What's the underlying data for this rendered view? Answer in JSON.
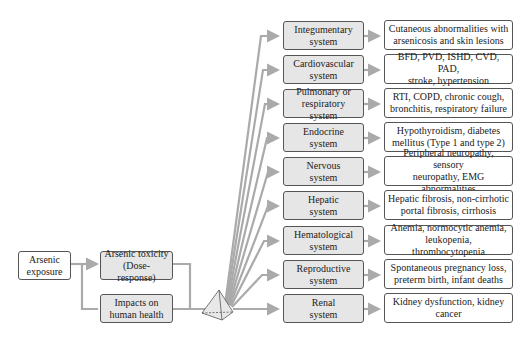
{
  "start": {
    "label_line1": "Arsenic",
    "label_line2": "exposure"
  },
  "toxicity": {
    "label_line1": "Arsenic toxicity",
    "label_line2": "(Dose-response)"
  },
  "impacts": {
    "label_line1": "Impacts on",
    "label_line2": "human health"
  },
  "hub_icon": "pyramid-icon",
  "colors": {
    "arrow": "#aaaaaa",
    "box_border": "#555555",
    "shaded_fill": "#e6e6e6"
  },
  "systems": [
    {
      "line1": "Integumentary",
      "line2": "system",
      "effect_line1": "Cutaneous abnormalities with",
      "effect_line2": "arsenicosis and skin lesions"
    },
    {
      "line1": "Cardiovascular",
      "line2": "system",
      "effect_line1": "BFD, PVD, ISHD, CVD, PAD,",
      "effect_line2": "stroke, hypertension"
    },
    {
      "line1": "Pulmonary or",
      "line2": "respiratory system",
      "effect_line1": "RTI, COPD, chronic cough,",
      "effect_line2": "bronchitis, respiratory failure"
    },
    {
      "line1": "Endocrine",
      "line2": "system",
      "effect_line1": "Hypothyroidism, diabetes",
      "effect_line2": "mellitus (Type 1 and type 2)"
    },
    {
      "line1": "Nervous",
      "line2": "system",
      "effect_line1": "Peripheral neuropathy, sensory",
      "effect_line2": "neuropathy, EMG abnormalities"
    },
    {
      "line1": "Hepatic",
      "line2": "system",
      "effect_line1": "Hepatic fibrosis, non-cirrhotic",
      "effect_line2": "portal fibrosis, cirrhosis"
    },
    {
      "line1": "Hematological",
      "line2": "system",
      "effect_line1": "Anemia, normocytic anemia,",
      "effect_line2": "leukopenia, thrombocytopenia"
    },
    {
      "line1": "Reproductive",
      "line2": "system",
      "effect_line1": "Spontaneous pregnancy loss,",
      "effect_line2": "preterm birth, infant deaths"
    },
    {
      "line1": "Renal",
      "line2": "system",
      "effect_line1": "Kidney dysfunction, kidney",
      "effect_line2": "cancer"
    }
  ]
}
